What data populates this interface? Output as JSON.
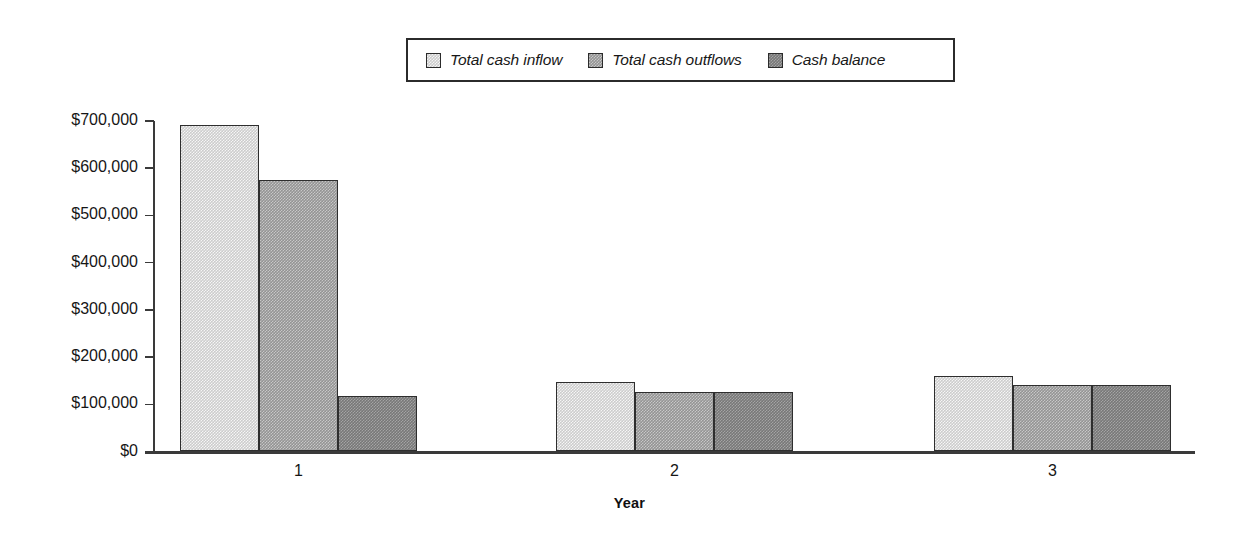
{
  "chart_data": {
    "type": "bar",
    "title": "",
    "subtitle": "",
    "xlabel": "Year",
    "ylabel": "",
    "categories": [
      "1",
      "2",
      "3"
    ],
    "series": [
      {
        "name": "Total cash inflow",
        "key": "inflow",
        "color": "#cccccc",
        "values": [
          692000,
          148000,
          159000
        ]
      },
      {
        "name": "Total cash outflows",
        "key": "outflow",
        "color": "#949494",
        "values": [
          575000,
          127000,
          140000
        ]
      },
      {
        "name": "Cash balance",
        "key": "balance",
        "color": "#787878",
        "values": [
          118000,
          127000,
          140000
        ]
      }
    ],
    "ylim": [
      0,
      700000
    ],
    "ytick_values": [
      0,
      100000,
      200000,
      300000,
      400000,
      500000,
      600000,
      700000
    ],
    "ytick_labels": [
      "$0",
      "$100,000",
      "$200,000",
      "$300,000",
      "$400,000",
      "$500,000",
      "$600,000",
      "$700,000"
    ],
    "grid": false,
    "legend_position": "top-center",
    "legend_entries": [
      "Total cash inflow",
      "Total cash outflows",
      "Cash balance"
    ],
    "axis_color": "#3a3a3a",
    "bar_border_color": "#2e2e2e",
    "background": "#ffffff"
  },
  "legend": {
    "items": [
      {
        "label": "Total cash inflow"
      },
      {
        "label": "Total cash outflows"
      },
      {
        "label": "Cash balance"
      }
    ]
  },
  "axes": {
    "x_title": "Year",
    "x_labels": [
      "1",
      "2",
      "3"
    ],
    "y_labels": [
      "$700,000",
      "$600,000",
      "$500,000",
      "$400,000",
      "$300,000",
      "$200,000",
      "$100,000",
      "$0"
    ]
  }
}
